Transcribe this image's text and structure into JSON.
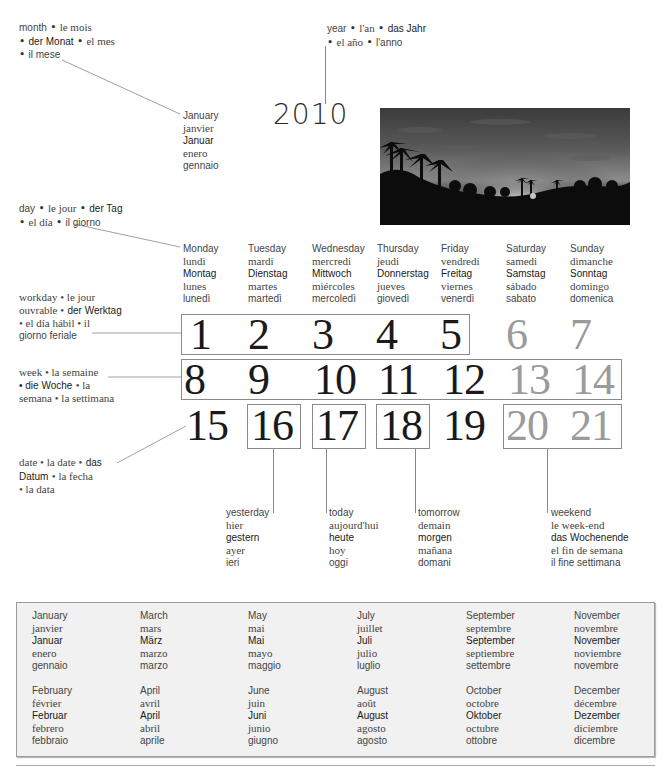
{
  "year": {
    "value": "2010",
    "label": {
      "en": "year",
      "fr": "l'an",
      "de": "das Jahr",
      "es": "el año",
      "it": "l'anno"
    }
  },
  "month_label": {
    "en": "month",
    "fr": "le mois",
    "de": "der Monat",
    "es": "el mes",
    "it": "il mese"
  },
  "current_month": {
    "en": "January",
    "fr": "janvier",
    "de": "Januar",
    "es": "enero",
    "it": "gennaio"
  },
  "day_label": {
    "en": "day",
    "fr": "le jour",
    "de": "der Tag",
    "es": "el día",
    "it": "il giorno"
  },
  "workday_label": {
    "line1": "workday • le jour",
    "line2_fr": "ouvrable •",
    "line2_de": "der Werktag",
    "line3": "• el día hábil • il",
    "line4": "giorno feriale"
  },
  "week_label": {
    "line1": "week • la semaine",
    "line2_de": "• die Woche",
    "line2_rest": "• la",
    "line3": "semana • la settimana"
  },
  "date_label": {
    "line1_en_fr": "date • la date •",
    "line1_de": "das",
    "line2_de": "Datum",
    "line2_rest": "• la fecha",
    "line3": "• la data"
  },
  "weekdays": [
    {
      "en": "Monday",
      "fr": "lundi",
      "de": "Montag",
      "es": "lunes",
      "it": "lunedì"
    },
    {
      "en": "Tuesday",
      "fr": "mardi",
      "de": "Dienstag",
      "es": "martes",
      "it": "martedì"
    },
    {
      "en": "Wednesday",
      "fr": "mercredi",
      "de": "Mittwoch",
      "es": "miércoles",
      "it": "mercoledì"
    },
    {
      "en": "Thursday",
      "fr": "jeudi",
      "de": "Donnerstag",
      "es": "jueves",
      "it": "giovedì"
    },
    {
      "en": "Friday",
      "fr": "vendredi",
      "de": "Freitag",
      "es": "viernes",
      "it": "venerdì"
    },
    {
      "en": "Saturday",
      "fr": "samedi",
      "de": "Samstag",
      "es": "sábado",
      "it": "sabato"
    },
    {
      "en": "Sunday",
      "fr": "dimanche",
      "de": "Sonntag",
      "es": "domingo",
      "it": "domenica"
    }
  ],
  "calendar": {
    "row1": [
      "1",
      "2",
      "3",
      "4",
      "5",
      "6",
      "7"
    ],
    "row2": [
      "8",
      "9",
      "10",
      "11",
      "12",
      "13",
      "14"
    ],
    "row3": [
      "15",
      "16",
      "17",
      "18",
      "19",
      "20",
      "21"
    ]
  },
  "relative_days": {
    "yesterday": {
      "en": "yesterday",
      "fr": "hier",
      "de": "gestern",
      "es": "ayer",
      "it": "ieri"
    },
    "today": {
      "en": "today",
      "fr": "aujourd'hui",
      "de": "heute",
      "es": "hoy",
      "it": "oggi"
    },
    "tomorrow": {
      "en": "tomorrow",
      "fr": "demain",
      "de": "morgen",
      "es": "mañana",
      "it": "domani"
    },
    "weekend": {
      "en": "weekend",
      "fr": "le week-end",
      "de": "das Wochenende",
      "es": "el fin de semana",
      "it": "il fine settimana"
    }
  },
  "months": [
    {
      "en": "January",
      "fr": "janvier",
      "de": "Januar",
      "es": "enero",
      "it": "gennaio"
    },
    {
      "en": "February",
      "fr": "février",
      "de": "Februar",
      "es": "febrero",
      "it": "febbraio"
    },
    {
      "en": "March",
      "fr": "mars",
      "de": "März",
      "es": "marzo",
      "it": "marzo"
    },
    {
      "en": "April",
      "fr": "avril",
      "de": "April",
      "es": "abril",
      "it": "aprile"
    },
    {
      "en": "May",
      "fr": "mai",
      "de": "Mai",
      "es": "mayo",
      "it": "maggio"
    },
    {
      "en": "June",
      "fr": "juin",
      "de": "Juni",
      "es": "junio",
      "it": "giugno"
    },
    {
      "en": "July",
      "fr": "juillet",
      "de": "Juli",
      "es": "julio",
      "it": "luglio"
    },
    {
      "en": "August",
      "fr": "août",
      "de": "August",
      "es": "agosto",
      "it": "agosto"
    },
    {
      "en": "September",
      "fr": "septembre",
      "de": "September",
      "es": "septiembre",
      "it": "settembre"
    },
    {
      "en": "October",
      "fr": "octobre",
      "de": "Oktober",
      "es": "octubre",
      "it": "ottobre"
    },
    {
      "en": "November",
      "fr": "novembre",
      "de": "November",
      "es": "noviembre",
      "it": "novembre"
    },
    {
      "en": "December",
      "fr": "décembre",
      "de": "Dezember",
      "es": "diciembre",
      "it": "dicembre"
    }
  ],
  "photo": {
    "subject": "palm trees silhouette at sunset"
  },
  "colors": {
    "weekday_number": "#1a1a1a",
    "weekend_number": "#9a9a9a",
    "box_border": "#8a8a8a",
    "months_box_bg": "#f1f1f1"
  }
}
